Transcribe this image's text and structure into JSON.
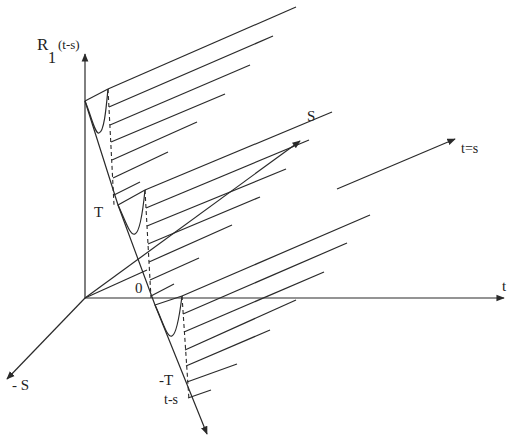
{
  "labels": {
    "y_axis_main": "R",
    "y_axis_sub": "1",
    "y_axis_arg": "(t-s)",
    "s_axis": "S",
    "neg_s_axis": "- S",
    "t_axis": "t",
    "diagonal": "t=s",
    "T": "T",
    "zero": "0",
    "neg_T": "-T",
    "t_minus_s": "t-s"
  },
  "axes": {
    "origin": [
      85,
      298
    ],
    "vertical_top": [
      85,
      52
    ],
    "t_axis_end": [
      505,
      298
    ],
    "s_axis_end": [
      301,
      140
    ],
    "neg_s_axis_end": [
      6,
      380
    ],
    "diagonal_start": [
      337,
      189
    ],
    "diagonal_end": [
      456,
      138
    ],
    "t_minus_s_axis_start": [
      85,
      101
    ],
    "t_minus_s_axis_end": [
      208,
      436
    ]
  },
  "groups": [
    {
      "name": "top",
      "left": [
        85,
        101
      ],
      "peak": [
        108,
        89
      ],
      "dip": [
        99,
        133
      ],
      "dash_end": [
        112,
        208
      ],
      "lines": [
        {
          "start": [
            108,
            89
          ],
          "end": [
            296,
            7
          ]
        },
        {
          "start": [
            109,
            107
          ],
          "end": [
            273,
            36
          ]
        },
        {
          "start": [
            110,
            125
          ],
          "end": [
            250,
            65
          ]
        },
        {
          "start": [
            111,
            142
          ],
          "end": [
            225,
            94
          ]
        },
        {
          "start": [
            112,
            160
          ],
          "end": [
            197,
            122
          ]
        },
        {
          "start": [
            113,
            178
          ],
          "end": [
            168,
            152
          ]
        },
        {
          "start": [
            114,
            195
          ],
          "end": [
            140,
            182
          ]
        }
      ]
    },
    {
      "name": "middle",
      "left": [
        118,
        205
      ],
      "peak": [
        145,
        190
      ],
      "dip": [
        135,
        234
      ],
      "dash_end": [
        150,
        298
      ],
      "lines": [
        {
          "start": [
            145,
            190
          ],
          "end": [
            332,
            112
          ]
        },
        {
          "start": [
            146,
            208
          ],
          "end": [
            309,
            140
          ]
        },
        {
          "start": [
            147,
            226
          ],
          "end": [
            286,
            169
          ]
        },
        {
          "start": [
            148,
            244
          ],
          "end": [
            260,
            197
          ]
        },
        {
          "start": [
            149,
            262
          ],
          "end": [
            232,
            225
          ]
        },
        {
          "start": [
            150,
            280
          ],
          "end": [
            199,
            258
          ]
        },
        {
          "start": [
            151,
            296
          ],
          "end": [
            174,
            284
          ]
        }
      ]
    },
    {
      "name": "bottom",
      "left": [
        155,
        305
      ],
      "peak": [
        182,
        296
      ],
      "dip": [
        172,
        336
      ],
      "dash_end": [
        188,
        398
      ],
      "lines": [
        {
          "start": [
            182,
            296
          ],
          "end": [
            370,
            215
          ]
        },
        {
          "start": [
            183,
            314
          ],
          "end": [
            347,
            243
          ]
        },
        {
          "start": [
            184,
            332
          ],
          "end": [
            324,
            272
          ]
        },
        {
          "start": [
            185,
            350
          ],
          "end": [
            296,
            300
          ]
        },
        {
          "start": [
            186,
            366
          ],
          "end": [
            270,
            330
          ]
        },
        {
          "start": [
            187,
            382
          ],
          "end": [
            237,
            364
          ]
        },
        {
          "start": [
            188,
            398
          ],
          "end": [
            211,
            390
          ]
        }
      ]
    }
  ],
  "colors": {
    "line": "#2a2a2a",
    "background": "#ffffff"
  }
}
